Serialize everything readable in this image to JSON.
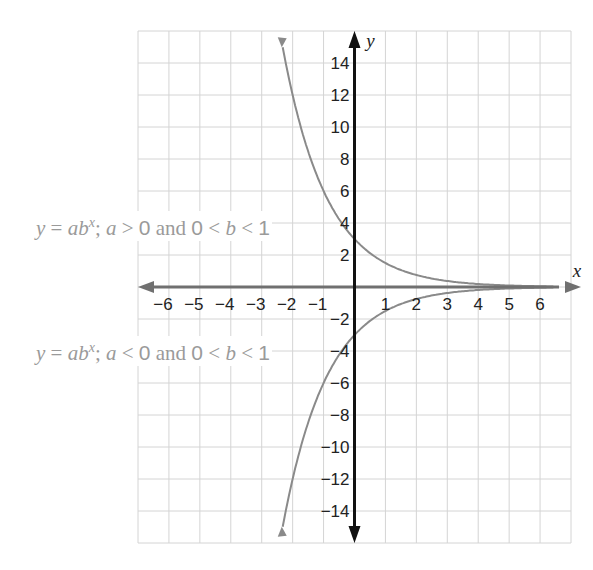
{
  "header": {
    "partial_title_text": "g   p"
  },
  "chart_data": {
    "type": "line",
    "title": "",
    "xlabel": "x",
    "ylabel": "y",
    "xlim": [
      -7,
      7
    ],
    "ylim": [
      -16,
      16
    ],
    "grid": true,
    "x_ticks": [
      -6,
      -5,
      -4,
      -3,
      -2,
      -1,
      1,
      2,
      3,
      4,
      5,
      6
    ],
    "y_ticks": [
      -14,
      -12,
      -10,
      -8,
      -6,
      -4,
      -2,
      2,
      4,
      6,
      8,
      10,
      12,
      14
    ],
    "series": [
      {
        "name": "y = ab^x; a > 0 and 0 < b < 1",
        "a": 3,
        "b": 0.5,
        "x": [
          -2.3,
          -2,
          -1.5,
          -1,
          -0.5,
          0,
          1,
          2,
          3,
          4,
          5,
          6.4
        ],
        "y": [
          14.8,
          12,
          8.5,
          6,
          4.2,
          3,
          1.5,
          0.75,
          0.375,
          0.19,
          0.09,
          0.03
        ]
      },
      {
        "name": "y = ab^x; a < 0 and 0 < b < 1",
        "a": -3,
        "b": 0.5,
        "x": [
          -2.3,
          -2,
          -1.5,
          -1,
          -0.5,
          0,
          1,
          2,
          3,
          4,
          5,
          6.4
        ],
        "y": [
          -14.8,
          -12,
          -8.5,
          -6,
          -4.2,
          -3,
          -1.5,
          -0.75,
          -0.375,
          -0.19,
          -0.09,
          -0.03
        ]
      }
    ],
    "annotations": [
      {
        "text": "y = ab^x; a > 0 and 0 < b < 1",
        "points_to": [
          0,
          4
        ]
      },
      {
        "text": "y = ab^x; a < 0 and 0 < b < 1",
        "points_to": [
          0,
          -4
        ]
      }
    ]
  },
  "labels": {
    "top": {
      "pre": "y",
      "eq": " = ",
      "ab": "ab",
      "sup": "x",
      "semi": "; ",
      "a": "a",
      "cond1": " > ",
      "zero": "0",
      "and": " and ",
      "zero2": "0",
      "lt": " < ",
      "b": "b",
      "lt2": " < ",
      "one": "1"
    },
    "bottom": {
      "pre": "y",
      "eq": " = ",
      "ab": "ab",
      "sup": "x",
      "semi": "; ",
      "a": "a",
      "cond1": " < ",
      "zero": "0",
      "and": " and ",
      "zero2": "0",
      "lt": " < ",
      "b": "b",
      "lt2": " < ",
      "one": "1"
    }
  },
  "colors": {
    "grid": "#d4d4d4",
    "axis": "#111111",
    "xaxis": "#707070",
    "curve": "#8a8a8a",
    "label": "#9a9a9a"
  }
}
